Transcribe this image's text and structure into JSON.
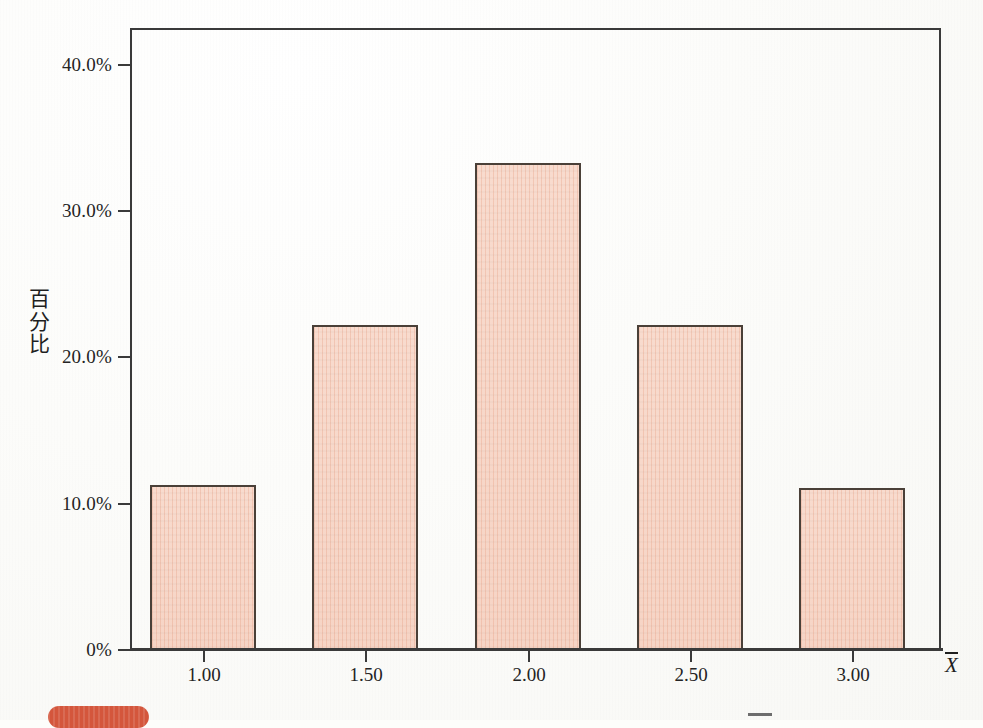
{
  "chart_data": {
    "type": "bar",
    "title": "",
    "subtitle": "",
    "xlabel": "X̄",
    "ylabel": "百分比",
    "categories": [
      "1.00",
      "1.50",
      "2.00",
      "2.50",
      "3.00"
    ],
    "values": [
      11.3,
      22.2,
      33.3,
      22.2,
      11.1
    ],
    "value_unit": "%",
    "ylim": [
      0,
      42.5
    ],
    "yticks": [
      0,
      10,
      20,
      30,
      40
    ],
    "ytick_labels": [
      "0%",
      "10.0%",
      "20.0%",
      "30.0%",
      "40.0%"
    ],
    "xticks": [
      "1.00",
      "1.50",
      "2.00",
      "2.50",
      "3.00"
    ],
    "grid": false,
    "legend": false,
    "legend_position": "none",
    "bar_fill_color": "#f7d8ca",
    "bar_border_color": "#4a4038",
    "axis_color": "#3a3a3a",
    "background_color": "#fdfdfb"
  },
  "axes": {
    "y_axis_title_chars": [
      "百",
      "分",
      "比"
    ],
    "x_axis_title_symbol": "X",
    "x_axis_title_has_overbar": true
  },
  "artifacts": {
    "pill_color": "#d4563c",
    "mark_color": "#6d6d6d"
  }
}
